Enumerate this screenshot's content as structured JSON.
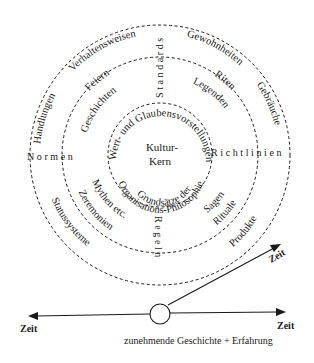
{
  "diagram": {
    "core": {
      "line1": "Kultur-",
      "line2": "Kern",
      "arc_top": "Wert- und Glaubensvorstellungen",
      "arc_bottom": "Grundsätze der",
      "arc_bottom2": "Organisations-Philosophie"
    },
    "axes_labels": {
      "top": "Standards",
      "right": "Richtlinien",
      "bottom": "Regeln",
      "left": "Normen"
    },
    "middle_ring": {
      "top_left": [
        "Feiern",
        "Geschichten"
      ],
      "top_right": [
        "Riten",
        "Legenden"
      ],
      "bottom_left": [
        "Mythen etc.",
        "Zeremonien"
      ],
      "bottom_right": [
        "Sagen",
        "Rituale"
      ]
    },
    "outer_ring": {
      "top_left": [
        "Verhaltensweisen",
        "Handlungen"
      ],
      "top_right": [
        "Gewohnheiten",
        "Gebräuche"
      ],
      "bottom_left": [
        "Statussysteme"
      ],
      "bottom_right": [
        "Produkte"
      ]
    },
    "timeline": {
      "left_label": "Zeit",
      "right_label": "Zeit",
      "diagonal_label": "Zeit",
      "caption": "zunehmende Geschichte + Erfahrung"
    },
    "colors": {
      "ink": "#1a1a1a",
      "background": "#ffffff"
    }
  }
}
